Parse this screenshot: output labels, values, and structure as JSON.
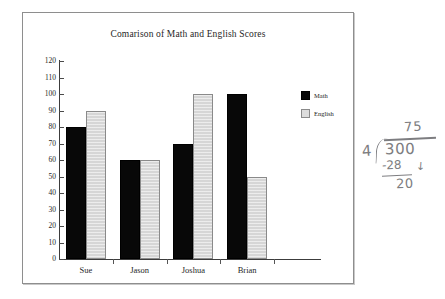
{
  "chart_data": {
    "type": "bar",
    "title": "Comarison of Math and English Scores",
    "xlabel": "",
    "ylabel": "",
    "categories": [
      "Sue",
      "Jason",
      "Joshua",
      "Brian"
    ],
    "series": [
      {
        "name": "Math",
        "color": "#080808",
        "values": [
          80,
          60,
          70,
          100
        ]
      },
      {
        "name": "English",
        "color": "#d6d6d6",
        "values": [
          90,
          60,
          100,
          50
        ]
      }
    ],
    "ylim": [
      0,
      120
    ],
    "ytick_step": 10,
    "yticks": [
      120,
      110,
      100,
      90,
      80,
      70,
      60,
      50,
      40,
      30,
      20,
      10,
      0
    ],
    "grid": false,
    "legend_position": "right"
  },
  "legend": {
    "items": [
      {
        "label": "Math",
        "swatch": "math"
      },
      {
        "label": "English",
        "swatch": "english"
      }
    ]
  },
  "annotation": {
    "type": "handwritten-long-division",
    "quotient": "75",
    "divisor": "4",
    "dividend": "300",
    "subtrahend": "-28",
    "remainder": "20",
    "carry_mark": "↓"
  }
}
